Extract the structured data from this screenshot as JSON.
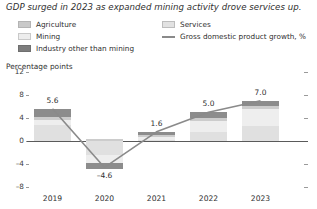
{
  "title": "GDP surged in 2023 as expanded mining activity drove services up.",
  "axis_title": "Percentage points",
  "legend": {
    "agriculture": "Agriculture",
    "mining": "Mining",
    "industry": "Industry other than mining",
    "services": "Services",
    "gdp": "Gross domestic product growth, %"
  },
  "colors": {
    "agriculture": "#cccccc",
    "mining": "#eeeeee",
    "industry": "#8c8c8c",
    "services": "#e0e0e0",
    "gdp_line": "#8a8a8a",
    "zero_line": "#5a5a5a",
    "text": "#2f2f2f"
  },
  "chart_data": {
    "type": "bar",
    "subtype": "stacked-bar-with-line",
    "title": "GDP surged in 2023 as expanded mining activity drove services up.",
    "xlabel": "",
    "ylabel": "Percentage points",
    "ylim": [
      -8,
      12
    ],
    "yticks": [
      12,
      8,
      4,
      0,
      -4,
      -8
    ],
    "grid": false,
    "legend_position": "top",
    "categories": [
      "2019",
      "2020",
      "2021",
      "2022",
      "2023"
    ],
    "series": [
      {
        "name": "Agriculture",
        "values": [
          0.6,
          0.3,
          0.4,
          0.5,
          0.6
        ]
      },
      {
        "name": "Mining",
        "values": [
          0.9,
          -1.4,
          0.5,
          1.9,
          2.9
        ]
      },
      {
        "name": "Industry other than mining",
        "values": [
          1.4,
          -1.1,
          0.5,
          1.0,
          0.9
        ]
      },
      {
        "name": "Services",
        "values": [
          2.7,
          -2.4,
          0.2,
          1.6,
          2.6
        ]
      }
    ],
    "line_series": {
      "name": "Gross domestic product growth, %",
      "values": [
        5.6,
        -4.6,
        1.6,
        5.0,
        7.0
      ]
    },
    "data_labels": [
      "5.6",
      "-4.6",
      "1.6",
      "5.0",
      "7.0"
    ]
  },
  "xticklabels": [
    "2019",
    "2020",
    "2021",
    "2022",
    "2023"
  ],
  "yticklabels": [
    "12",
    "8",
    "4",
    "0",
    "-4",
    "-8"
  ],
  "datalabels": {
    "y2019": "5.6",
    "y2020": "–4.6",
    "y2021": "1.6",
    "y2022": "5.0",
    "y2023": "7.0"
  }
}
